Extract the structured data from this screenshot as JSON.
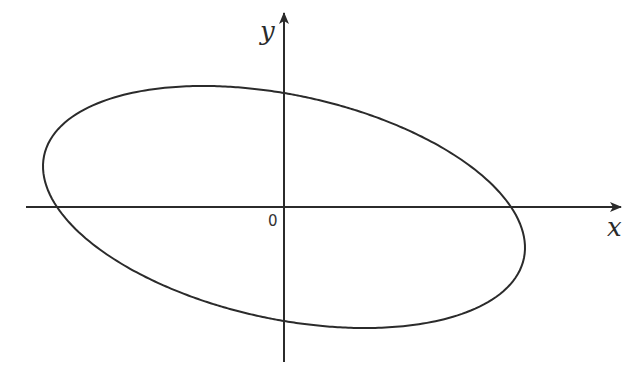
{
  "figure": {
    "x_axis_label": "x",
    "y_axis_label": "y",
    "origin_label": "0",
    "stroke_color": "#2b2b2b",
    "background": "#ffffff"
  },
  "geometry": {
    "origin": [
      284,
      207
    ],
    "x_axis": {
      "from": 26,
      "to": 622
    },
    "y_axis": {
      "from": 362,
      "to": 12
    },
    "ellipse": {
      "type": "rotated ellipse centered at origin, tilted upward to the right",
      "x_intercepts_px": [
        -227,
        227
      ],
      "y_intercepts_px": [
        114,
        -114
      ],
      "extent_x_px": 241,
      "extent_y_px": 121
    }
  }
}
